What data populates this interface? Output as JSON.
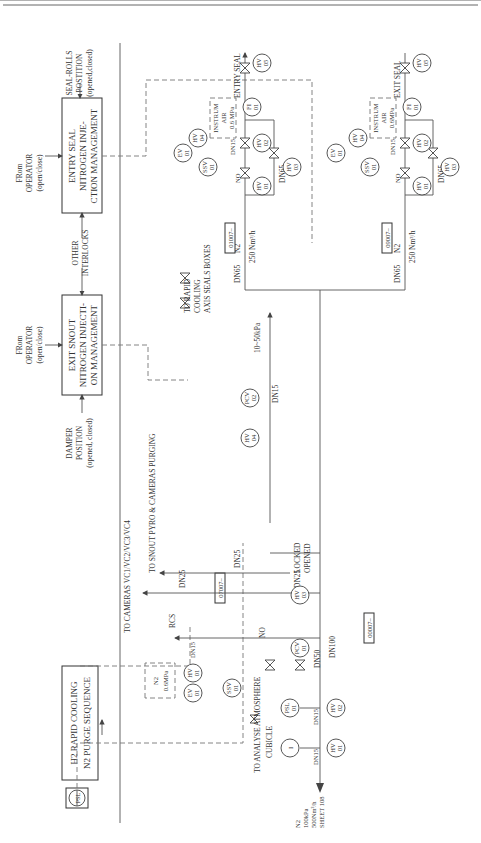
{
  "control_blocks": {
    "entry_seal": {
      "lines": [
        "ENTRY SEAL",
        "NITROGEN INJE-",
        "CTION MANAGEMENT"
      ]
    },
    "exit_snout": {
      "lines": [
        "EXIT SNOUT",
        "NITROGEN INJECTI-",
        "ON MANAGEMENT"
      ]
    },
    "h2_rapid": {
      "lines": [
        "H2 RAPID COOLING",
        "N2 PURGE SEQUENCE"
      ]
    },
    "psl_tag": "PSL"
  },
  "signals": {
    "seal_rolls": [
      "SEAL-ROLLS",
      "POSTITION",
      "(opened,closed)"
    ],
    "from_operator_1": [
      "FRom",
      "OPERATOR",
      "(open/close)"
    ],
    "from_operator_2": [
      "FRom",
      "OPERATOR",
      "(open/close)"
    ],
    "other_interlocks": [
      "OTHER",
      "INTERLOCKS"
    ],
    "damper_position": [
      "DAMPER",
      "POSITION",
      "(opened, closed)"
    ]
  },
  "destinations": {
    "entry_seal": "ENTRY SEAL",
    "exit_seal": "EXIT SEAL",
    "to_cameras": "TO CAMERAS VC1/VC2/VC3/VC4",
    "to_snout": "TO SNOUT PYRO & CAMERAS PURGING",
    "to_rapid": [
      "TO RAPID",
      "COOLING",
      "AXIS SEALS BOXES"
    ],
    "rcs": "RCS",
    "to_analyse": [
      "TO ANALYSE ATMOSPHERE",
      "CUBICLE"
    ],
    "supply": [
      "N2",
      "100kPa",
      "500Nm³/h",
      "SHEET 108"
    ]
  },
  "instrum_air": {
    "upper": [
      "INSTRUM",
      "AIR",
      "0.6 MPa"
    ],
    "lower": [
      "INSTRUM",
      "AIR",
      "0.6MPa"
    ],
    "n2_box": [
      "N2",
      "0.6MPa"
    ]
  },
  "line_labels": {
    "dn15": "DN15",
    "dn25": "DN25",
    "dn50": "DN50",
    "dn65": "DN65",
    "dn100": "DN100",
    "n2": "N2",
    "flow": "250 Nm³/h",
    "pressure": "10~50kPa",
    "locked": [
      "LOCKED",
      "OPENED"
    ],
    "no": "NO"
  },
  "section_tags": [
    "01007–",
    "09007–",
    "07007–",
    "00007–"
  ],
  "instruments": {
    "hv01": [
      "HV",
      "01"
    ],
    "hv02": [
      "HV",
      "02"
    ],
    "hv03": [
      "HV",
      "03"
    ],
    "hv04": [
      "HV",
      "04"
    ],
    "hv05": [
      "HV",
      "05"
    ],
    "fi01": [
      "FI",
      "01"
    ],
    "ssv01": [
      "SSV",
      "01"
    ],
    "ev01": [
      "EV",
      "01"
    ],
    "pcv01": [
      "PCV",
      "01"
    ],
    "pcv02": [
      "PCV",
      "02"
    ],
    "psl01": [
      "PSL",
      "01"
    ],
    "i": "I"
  }
}
